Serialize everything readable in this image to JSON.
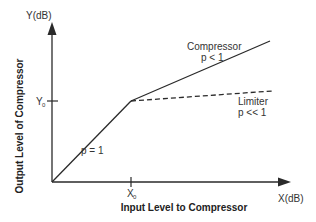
{
  "diagram": {
    "y_axis": {
      "label": "Y(dB)",
      "title": "Output  Level of Compressor"
    },
    "x_axis": {
      "label": "X(dB)",
      "title": "Input Level to Compressor"
    },
    "ticks": {
      "y0": {
        "main": "Y",
        "sub": "0"
      },
      "x0": {
        "main": "X",
        "sub": "0"
      }
    },
    "segments": {
      "unity": {
        "label": "p = 1"
      },
      "compressor": {
        "name": "Compressor",
        "label": "p < 1"
      },
      "limiter": {
        "name": "Limiter",
        "label": "p << 1"
      }
    },
    "colors": {
      "line": "#2a2a2a",
      "text": "#333333",
      "background": "#ffffff"
    }
  }
}
